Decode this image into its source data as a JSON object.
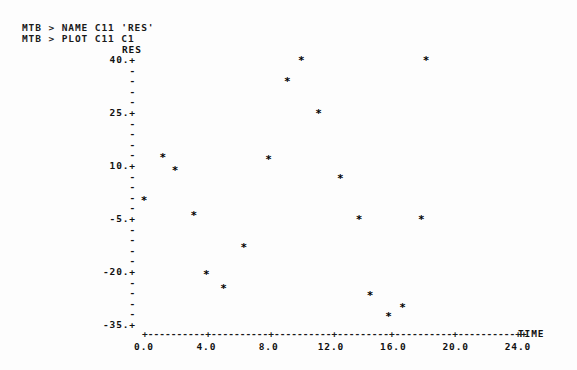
{
  "terminal": {
    "prompt": "MTB >",
    "lines": [
      "MTB > NAME C11 'RES'",
      "MTB > PLOT C11 C1"
    ]
  },
  "chart_data": {
    "type": "scatter",
    "title": "",
    "xlabel": "TIME",
    "ylabel": "RES",
    "xlim": [
      -1.0,
      25.5
    ],
    "ylim": [
      -35,
      43
    ],
    "xticks": [
      0.0,
      4.0,
      8.0,
      12.0,
      16.0,
      20.0,
      24.0
    ],
    "xticklabels": [
      "0.0",
      "4.0",
      "8.0",
      "12.0",
      "16.0",
      "20.0",
      "24.0"
    ],
    "yticks": [
      40,
      25,
      10,
      -5,
      -20,
      -35
    ],
    "yticklabels": [
      "40.",
      "25.",
      "10.",
      "-5.",
      "-20.",
      "-35."
    ],
    "y_minor_per_major": 5,
    "grid": false,
    "legend": null,
    "marker": "*",
    "points": [
      {
        "x": 10.1,
        "y": 40.0
      },
      {
        "x": 18.1,
        "y": 40.0
      },
      {
        "x": 9.2,
        "y": 34.0
      },
      {
        "x": 11.2,
        "y": 25.0
      },
      {
        "x": 8.0,
        "y": 12.0
      },
      {
        "x": 1.2,
        "y": 12.5
      },
      {
        "x": 2.0,
        "y": 9.0
      },
      {
        "x": 12.6,
        "y": 6.5
      },
      {
        "x": 0.0,
        "y": 0.5
      },
      {
        "x": 3.2,
        "y": -4.0
      },
      {
        "x": 13.8,
        "y": -5.0
      },
      {
        "x": 17.8,
        "y": -5.0
      },
      {
        "x": 6.4,
        "y": -13.0
      },
      {
        "x": 4.0,
        "y": -20.5
      },
      {
        "x": 5.1,
        "y": -24.5
      },
      {
        "x": 14.5,
        "y": -26.5
      },
      {
        "x": 16.6,
        "y": -30.0
      },
      {
        "x": 15.7,
        "y": -32.5
      }
    ]
  }
}
